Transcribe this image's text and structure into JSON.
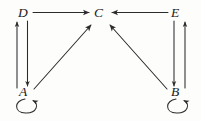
{
  "figure": {
    "type": "directed-graph",
    "background_color": "#fdfdfc",
    "stroke_color": "#2b2b2b",
    "label_color": "#1a1a1a",
    "width": 201,
    "height": 121
  },
  "nodes": [
    {
      "id": "A",
      "label": "A",
      "x": 26,
      "y": 92
    },
    {
      "id": "B",
      "label": "B",
      "x": 177,
      "y": 92
    },
    {
      "id": "C",
      "label": "C",
      "x": 100,
      "y": 13
    },
    {
      "id": "D",
      "label": "D",
      "x": 24,
      "y": 13
    },
    {
      "id": "E",
      "label": "E",
      "x": 177,
      "y": 13
    }
  ],
  "edges": [
    {
      "from": "D",
      "to": "C",
      "kind": "straight-horizontal"
    },
    {
      "from": "E",
      "to": "C",
      "kind": "straight-horizontal"
    },
    {
      "from": "A",
      "to": "C",
      "kind": "straight-diagonal"
    },
    {
      "from": "B",
      "to": "C",
      "kind": "straight-diagonal"
    },
    {
      "from": "D",
      "to": "A",
      "kind": "straight-vertical"
    },
    {
      "from": "A",
      "to": "D",
      "kind": "straight-vertical"
    },
    {
      "from": "E",
      "to": "B",
      "kind": "straight-vertical"
    },
    {
      "from": "B",
      "to": "E",
      "kind": "straight-vertical"
    },
    {
      "from": "A",
      "to": "A",
      "kind": "self-loop"
    },
    {
      "from": "B",
      "to": "B",
      "kind": "self-loop"
    }
  ]
}
